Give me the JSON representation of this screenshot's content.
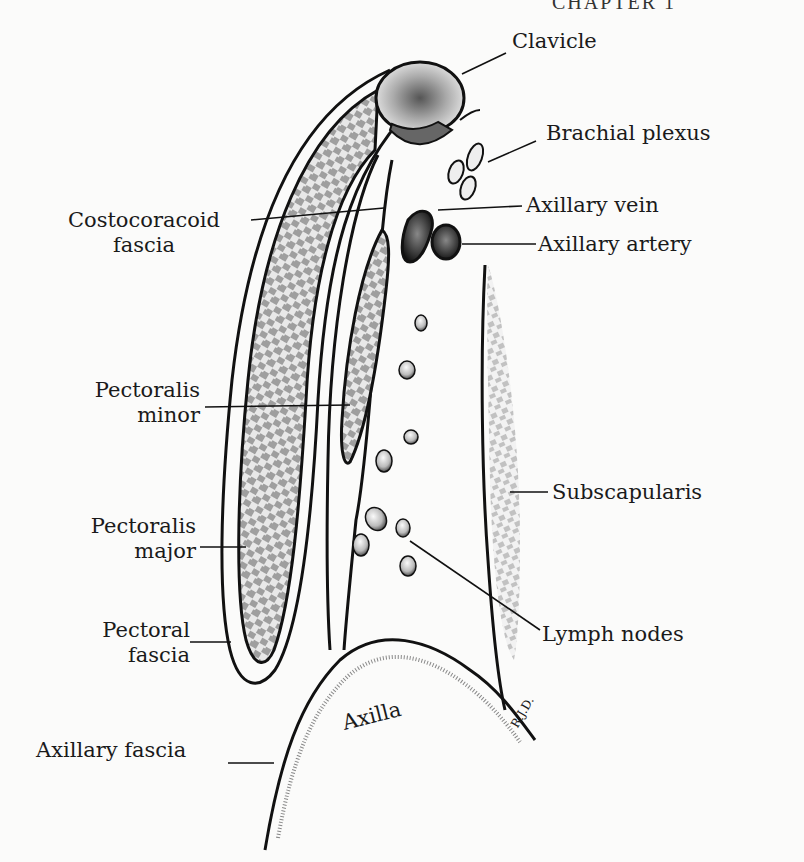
{
  "page": {
    "header": "CHAPTER 1"
  },
  "figure": {
    "labels": {
      "clavicle": "Clavicle",
      "brachial_plexus": "Brachial plexus",
      "axillary_vein": "Axillary vein",
      "axillary_artery": "Axillary artery",
      "costocoracoid_fascia_1": "Costocoracoid",
      "costocoracoid_fascia_2": "fascia",
      "pectoralis_minor_1": "Pectoralis",
      "pectoralis_minor_2": "minor",
      "subscapularis": "Subscapularis",
      "pectoralis_major_1": "Pectoralis",
      "pectoralis_major_2": "major",
      "lymph_nodes": "Lymph nodes",
      "pectoral_fascia_1": "Pectoral",
      "pectoral_fascia_2": "fascia",
      "axilla": "Axilla",
      "axillary_fascia": "Axillary fascia",
      "signature": "R.J.D."
    },
    "colors": {
      "ink": "#1a1a1a",
      "paper": "#fbfbfa",
      "hatch": "#555555"
    }
  }
}
